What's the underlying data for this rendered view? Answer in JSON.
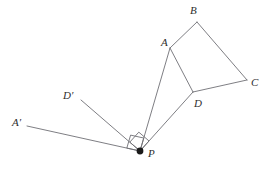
{
  "figure": {
    "kind": "geometry-diagram",
    "width": 268,
    "height": 171,
    "background_color": "#ffffff",
    "stroke_color": "#6f6f75",
    "label_color": "#2e2e2e",
    "stroke_width": 0.9
  },
  "labels": {
    "A": "A",
    "B": "B",
    "C": "C",
    "D": "D",
    "A_prime": "A′",
    "D_prime": "D′",
    "P": "P"
  },
  "label_positions": {
    "A": {
      "x": 161,
      "y": 37
    },
    "B": {
      "x": 190,
      "y": 5
    },
    "C": {
      "x": 251,
      "y": 77
    },
    "D": {
      "x": 194,
      "y": 98
    },
    "A_prime": {
      "x": 12,
      "y": 117
    },
    "D_prime": {
      "x": 63,
      "y": 90
    },
    "P": {
      "x": 148,
      "y": 148
    }
  },
  "points": {
    "A": {
      "x": 170,
      "y": 48
    },
    "B": {
      "x": 197,
      "y": 22
    },
    "C": {
      "x": 247,
      "y": 80
    },
    "D": {
      "x": 193,
      "y": 92
    },
    "A_prime": {
      "x": 27,
      "y": 126
    },
    "D_prime": {
      "x": 81,
      "y": 100
    },
    "P": {
      "x": 140,
      "y": 151
    }
  },
  "segments": [
    {
      "name": "segment-AB",
      "from": "A",
      "to": "B"
    },
    {
      "name": "segment-BC",
      "from": "B",
      "to": "C"
    },
    {
      "name": "segment-CD",
      "from": "C",
      "to": "D"
    },
    {
      "name": "segment-DA",
      "from": "D",
      "to": "A"
    },
    {
      "name": "segment-PA",
      "from": "P",
      "to": "A"
    },
    {
      "name": "segment-PD",
      "from": "P",
      "to": "D"
    },
    {
      "name": "segment-PA-prime",
      "from": "P",
      "to": "A_prime"
    },
    {
      "name": "segment-PD-prime",
      "from": "P",
      "to": "D_prime"
    }
  ],
  "right_angle_marks": [
    {
      "name": "right-angle-mark-at-P-outer",
      "vertex": "P",
      "size": 13.5,
      "ray_a": "A_prime",
      "ray_b": "A"
    },
    {
      "name": "right-angle-mark-at-P-inner",
      "vertex": "P",
      "size": 13.5,
      "ray_a": "D_prime",
      "ray_b": "D"
    }
  ],
  "markers": [
    {
      "name": "point-marker-P",
      "at": "P",
      "radius": 3.4,
      "fill": "#1a1a1a"
    }
  ]
}
